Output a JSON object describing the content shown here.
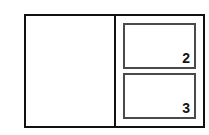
{
  "diagram": {
    "background_color": "#ffffff",
    "outer_frame": {
      "name": "outer-frame",
      "border_color": "#111111",
      "border_width_px": 2
    },
    "panels": [
      {
        "name": "left-panel",
        "label": "",
        "border_color": "#111111",
        "content": "empty"
      },
      {
        "name": "right-panel",
        "label": "",
        "content": "stacked-boxes"
      }
    ],
    "cells": [
      {
        "name": "cell-2",
        "label": "2",
        "border_color": "#4a4a4a",
        "border_width_px": 2,
        "label_position": "bottom-right"
      },
      {
        "name": "cell-3",
        "label": "3",
        "border_color": "#4a4a4a",
        "border_width_px": 2,
        "label_position": "bottom-right"
      }
    ]
  }
}
